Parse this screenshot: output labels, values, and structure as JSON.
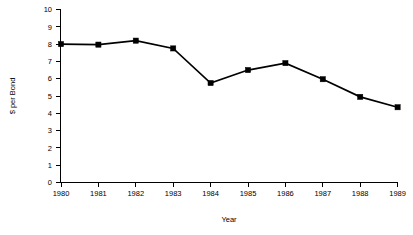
{
  "chart_data": {
    "type": "line",
    "title": "",
    "xlabel": "Year",
    "ylabel": "$ per Bond",
    "x": [
      1980,
      1981,
      1982,
      1983,
      1984,
      1985,
      1986,
      1987,
      1988,
      1989
    ],
    "categories": [
      "1980",
      "1981",
      "1982",
      "1983",
      "1984",
      "1985",
      "1986",
      "1987",
      "1988",
      "1989"
    ],
    "values": [
      8.0,
      7.97,
      8.2,
      7.75,
      5.75,
      6.5,
      6.9,
      5.97,
      4.95,
      4.35
    ],
    "series": [
      {
        "name": "$ per Bond",
        "values": [
          8.0,
          7.97,
          8.2,
          7.75,
          5.75,
          6.5,
          6.9,
          5.97,
          4.95,
          4.35
        ]
      }
    ],
    "ylim": [
      0,
      10
    ],
    "xlim": [
      1980,
      1989
    ],
    "ytick_labels": [
      "0",
      "1",
      "2",
      "3",
      "4",
      "5",
      "6",
      "7",
      "8",
      "9",
      "10"
    ],
    "ytick_values": [
      0,
      1,
      2,
      3,
      4,
      5,
      6,
      7,
      8,
      9,
      10
    ],
    "xtick_labels": [
      "1980",
      "1981",
      "1982",
      "1983",
      "1984",
      "1985",
      "1986",
      "1987",
      "1988",
      "1989"
    ],
    "grid": false,
    "legend": false,
    "legend_position": "none",
    "marker": "square",
    "line_color": "#000000",
    "marker_color": "#000000",
    "background_color": "#ffffff"
  },
  "axes": {
    "y_title": "$ per Bond",
    "x_title": "Year"
  }
}
